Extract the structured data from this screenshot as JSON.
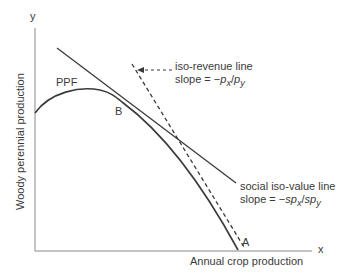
{
  "diagram": {
    "axes": {
      "y_symbol": "y",
      "x_symbol": "x",
      "y_label": "Woody perennial production",
      "x_label": "Annual crop production"
    },
    "curves": {
      "ppf_label": "PPF",
      "point_b": "B",
      "point_a": "A"
    },
    "annotations": {
      "iso_revenue_title": "iso-revenue line",
      "iso_revenue_slope_prefix": "slope = −",
      "iso_revenue_slope_p1": "p",
      "iso_revenue_slope_sub1": "x",
      "iso_revenue_slope_sep": "/",
      "iso_revenue_slope_p2": "p",
      "iso_revenue_slope_sub2": "y",
      "social_title": "social iso-value line",
      "social_slope_prefix": "slope = −",
      "social_slope_p1": "sp",
      "social_slope_sub1": "x",
      "social_slope_sep": "/",
      "social_slope_p2": "sp",
      "social_slope_sub2": "y"
    },
    "colors": {
      "line": "#3a3a3a",
      "axis": "#888888"
    }
  }
}
